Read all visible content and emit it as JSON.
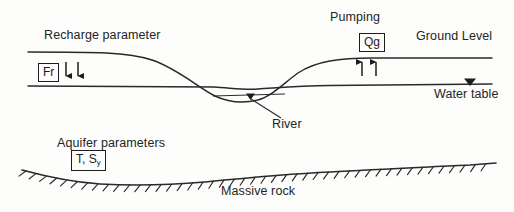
{
  "diagram": {
    "background_color": "#fdfdfc",
    "ink_color": "#242424"
  },
  "labels": {
    "recharge_parameter": "Recharge parameter",
    "pumping": "Pumping",
    "ground_level": "Ground Level",
    "water_table": "Water table",
    "river": "River",
    "aquifer_parameters": "Aquifer parameters",
    "massive_rock": "Massive rock"
  },
  "boxed_symbols": {
    "recharge_flux": "Fr",
    "pumping_discharge": "Qg",
    "aquifer_props_main": "T, S",
    "aquifer_props_subscript": "y"
  },
  "arrows": {
    "recharge_direction": "down",
    "recharge_count": 2,
    "pumping_direction": "up",
    "pumping_count": 2
  },
  "markers": {
    "water_table_symbol": "filled-down-triangle",
    "river_symbol": "filled-down-triangle"
  },
  "chart_data": {
    "type": "line",
    "xlabel": "",
    "ylabel": "",
    "xlim": [
      0,
      514
    ],
    "ylim": [
      212,
      0
    ],
    "grid": false,
    "legend": "none",
    "series": [
      {
        "name": "Ground Level",
        "x": [
          28,
          70,
          110,
          145,
          175,
          200,
          225,
          250,
          268,
          290,
          320,
          355,
          400,
          450,
          492
        ],
        "y": [
          52,
          52,
          53,
          57,
          67,
          80,
          93,
          101,
          98,
          86,
          72,
          63,
          59,
          58,
          58
        ]
      },
      {
        "name": "Water table",
        "x": [
          28,
          120,
          200,
          240,
          262,
          300,
          340,
          400,
          460,
          492
        ],
        "y": [
          86,
          86,
          86,
          88,
          90,
          88,
          86,
          85,
          84,
          84
        ]
      },
      {
        "name": "Massive rock (bedrock)",
        "x": [
          22,
          70,
          120,
          170,
          220,
          270,
          320,
          370,
          420,
          470,
          496
        ],
        "y": [
          170,
          179,
          184,
          185,
          182,
          177,
          173,
          171,
          169,
          166,
          164
        ]
      }
    ]
  }
}
